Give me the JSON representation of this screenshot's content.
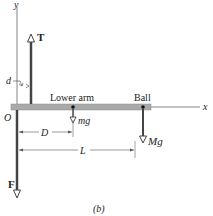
{
  "figure": {
    "caption": "(b)",
    "axes": {
      "x_label": "x",
      "y_label": "y",
      "origin_label": "O"
    },
    "forces": {
      "tension": {
        "label": "T"
      },
      "force_f": {
        "label": "F"
      },
      "arm_weight": {
        "label": "mg"
      },
      "ball_weight": {
        "label": "Mg"
      }
    },
    "objects": {
      "lower_arm": {
        "label": "Lower arm"
      },
      "ball": {
        "label": "Ball"
      }
    },
    "dimensions": {
      "d": {
        "label": "d"
      },
      "D": {
        "label": "D"
      },
      "L": {
        "label": "L"
      }
    },
    "colors": {
      "arrow": "#444444",
      "arm": "#a9a9a9",
      "axis": "#555555"
    }
  }
}
